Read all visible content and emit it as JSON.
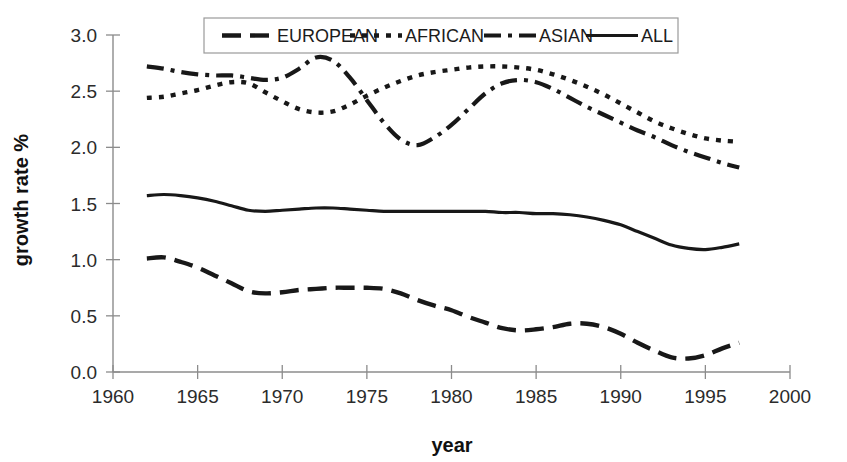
{
  "chart_data": {
    "type": "line",
    "title": "",
    "xlabel": "year",
    "ylabel": "growth rate %",
    "xlim": [
      1960,
      2000
    ],
    "ylim": [
      0.0,
      3.0
    ],
    "xticks": [
      1960,
      1965,
      1970,
      1975,
      1980,
      1985,
      1990,
      1995,
      2000
    ],
    "xtick_labels": [
      "1960",
      "1965",
      "1970",
      "1975",
      "1980",
      "1985",
      "1990",
      "1995",
      "2000"
    ],
    "yticks": [
      0.0,
      0.5,
      1.0,
      1.5,
      2.0,
      2.5,
      3.0
    ],
    "ytick_labels": [
      "0.0",
      "0.5",
      "1.0",
      "1.5",
      "2.0",
      "2.5",
      "3.0"
    ],
    "grid": false,
    "legend_position": "top-center",
    "x": [
      1962,
      1963,
      1964,
      1965,
      1966,
      1967,
      1968,
      1969,
      1970,
      1971,
      1972,
      1973,
      1974,
      1975,
      1976,
      1977,
      1978,
      1979,
      1980,
      1981,
      1982,
      1983,
      1984,
      1985,
      1986,
      1987,
      1988,
      1989,
      1990,
      1991,
      1992,
      1993,
      1994,
      1995,
      1996,
      1997
    ],
    "series": [
      {
        "name": "EUROPEAN",
        "dash_style": "long-dash",
        "color": "#181818",
        "values": [
          1.01,
          1.02,
          0.98,
          0.93,
          0.86,
          0.79,
          0.72,
          0.7,
          0.71,
          0.73,
          0.74,
          0.75,
          0.75,
          0.75,
          0.74,
          0.7,
          0.64,
          0.59,
          0.55,
          0.49,
          0.44,
          0.39,
          0.37,
          0.38,
          0.4,
          0.43,
          0.43,
          0.4,
          0.34,
          0.26,
          0.19,
          0.13,
          0.12,
          0.15,
          0.21,
          0.26
        ]
      },
      {
        "name": "AFRICAN",
        "dash_style": "dotted",
        "color": "#181818",
        "values": [
          2.44,
          2.45,
          2.48,
          2.51,
          2.55,
          2.58,
          2.57,
          2.49,
          2.41,
          2.34,
          2.31,
          2.32,
          2.38,
          2.46,
          2.53,
          2.59,
          2.64,
          2.67,
          2.69,
          2.71,
          2.72,
          2.72,
          2.71,
          2.69,
          2.65,
          2.6,
          2.54,
          2.47,
          2.39,
          2.31,
          2.23,
          2.17,
          2.12,
          2.08,
          2.06,
          2.05
        ]
      },
      {
        "name": "ASIAN",
        "dash_style": "dash-dot",
        "color": "#181818",
        "values": [
          2.72,
          2.7,
          2.67,
          2.65,
          2.64,
          2.64,
          2.62,
          2.6,
          2.62,
          2.7,
          2.8,
          2.77,
          2.62,
          2.42,
          2.22,
          2.07,
          2.02,
          2.09,
          2.2,
          2.34,
          2.48,
          2.57,
          2.6,
          2.58,
          2.52,
          2.44,
          2.36,
          2.29,
          2.22,
          2.15,
          2.09,
          2.02,
          1.96,
          1.91,
          1.86,
          1.82
        ]
      },
      {
        "name": "ALL",
        "dash_style": "solid",
        "color": "#181818",
        "values": [
          1.57,
          1.58,
          1.57,
          1.55,
          1.52,
          1.48,
          1.44,
          1.43,
          1.44,
          1.45,
          1.46,
          1.46,
          1.45,
          1.44,
          1.43,
          1.43,
          1.43,
          1.43,
          1.43,
          1.43,
          1.43,
          1.42,
          1.42,
          1.41,
          1.41,
          1.4,
          1.38,
          1.35,
          1.31,
          1.25,
          1.19,
          1.13,
          1.1,
          1.09,
          1.11,
          1.14
        ]
      }
    ],
    "legend": [
      {
        "label": "EUROPEAN",
        "dash_style": "long-dash"
      },
      {
        "label": "AFRICAN",
        "dash_style": "dotted"
      },
      {
        "label": "ASIAN",
        "dash_style": "dash-dot"
      },
      {
        "label": "ALL",
        "dash_style": "solid"
      }
    ]
  }
}
